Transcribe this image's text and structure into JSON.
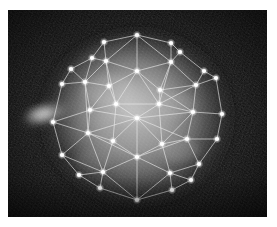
{
  "image": {
    "title": "Triangulated mesh overlay on glowing spheroid",
    "kind": "grayscale-scientific-image",
    "alt_text": "A bright diffuse glowing round object on a dark noisy background, overlaid with a white wireframe triangular mesh connecting bright point nodes.",
    "width": 277,
    "height": 227,
    "margin": {
      "left": 8,
      "top": 10,
      "right": 10,
      "bottom": 11
    },
    "plate": {
      "x": 8,
      "y": 10,
      "width": 259,
      "height": 207
    },
    "colors": {
      "page_background": "#ffffff",
      "plate_background": "#070707",
      "glow_core": "#b9b9b9",
      "glow_mid": "#6e6e6e",
      "glow_outer": "#2a2a2a",
      "node_fill": "#ffffff",
      "edge_stroke": "#e8e8e8",
      "flare": "#f2f2f2"
    },
    "glow": {
      "cx": 137,
      "cy": 117,
      "rx": 95,
      "ry": 88,
      "label": "diffuse luminous halo"
    },
    "flare": {
      "cx": 46,
      "cy": 114,
      "rx": 26,
      "ry": 13,
      "angle": -18,
      "label": "lateral bright flare spike"
    },
    "mesh": {
      "node_count": 38,
      "edge_count": 97,
      "node_radius": 2.1,
      "edge_width": 0.75,
      "nodes": [
        {
          "id": 0,
          "x": 137,
          "y": 35,
          "ring": "hull"
        },
        {
          "id": 1,
          "x": 104,
          "y": 42,
          "ring": "hull"
        },
        {
          "id": 2,
          "x": 171,
          "y": 43,
          "ring": "hull"
        },
        {
          "id": 3,
          "x": 180,
          "y": 52,
          "ring": "hull"
        },
        {
          "id": 4,
          "x": 92,
          "y": 58,
          "ring": "hull"
        },
        {
          "id": 5,
          "x": 71,
          "y": 69,
          "ring": "hull"
        },
        {
          "id": 6,
          "x": 204,
          "y": 71,
          "ring": "hull"
        },
        {
          "id": 7,
          "x": 216,
          "y": 78,
          "ring": "hull"
        },
        {
          "id": 8,
          "x": 62,
          "y": 84,
          "ring": "hull"
        },
        {
          "id": 9,
          "x": 222,
          "y": 114,
          "ring": "hull"
        },
        {
          "id": 10,
          "x": 53,
          "y": 122,
          "ring": "hull"
        },
        {
          "id": 11,
          "x": 217,
          "y": 139,
          "ring": "hull"
        },
        {
          "id": 12,
          "x": 62,
          "y": 155,
          "ring": "hull"
        },
        {
          "id": 13,
          "x": 199,
          "y": 164,
          "ring": "hull"
        },
        {
          "id": 14,
          "x": 79,
          "y": 175,
          "ring": "hull"
        },
        {
          "id": 15,
          "x": 191,
          "y": 180,
          "ring": "hull"
        },
        {
          "id": 16,
          "x": 100,
          "y": 188,
          "ring": "hull"
        },
        {
          "id": 17,
          "x": 172,
          "y": 190,
          "ring": "hull"
        },
        {
          "id": 18,
          "x": 137,
          "y": 200,
          "ring": "hull"
        },
        {
          "id": 19,
          "x": 106,
          "y": 61,
          "ring": "inner1"
        },
        {
          "id": 20,
          "x": 137,
          "y": 71,
          "ring": "inner1"
        },
        {
          "id": 21,
          "x": 171,
          "y": 62,
          "ring": "inner1"
        },
        {
          "id": 22,
          "x": 196,
          "y": 85,
          "ring": "inner1"
        },
        {
          "id": 23,
          "x": 85,
          "y": 82,
          "ring": "inner1"
        },
        {
          "id": 24,
          "x": 109,
          "y": 86,
          "ring": "inner1"
        },
        {
          "id": 25,
          "x": 160,
          "y": 90,
          "ring": "inner1"
        },
        {
          "id": 26,
          "x": 116,
          "y": 104,
          "ring": "inner1"
        },
        {
          "id": 27,
          "x": 159,
          "y": 104,
          "ring": "inner1"
        },
        {
          "id": 28,
          "x": 90,
          "y": 110,
          "ring": "inner1"
        },
        {
          "id": 29,
          "x": 193,
          "y": 112,
          "ring": "inner1"
        },
        {
          "id": 30,
          "x": 137,
          "y": 118,
          "ring": "center"
        },
        {
          "id": 31,
          "x": 88,
          "y": 133,
          "ring": "inner2"
        },
        {
          "id": 32,
          "x": 187,
          "y": 139,
          "ring": "inner2"
        },
        {
          "id": 33,
          "x": 113,
          "y": 141,
          "ring": "inner2"
        },
        {
          "id": 34,
          "x": 162,
          "y": 144,
          "ring": "inner2"
        },
        {
          "id": 35,
          "x": 137,
          "y": 157,
          "ring": "inner2"
        },
        {
          "id": 36,
          "x": 103,
          "y": 172,
          "ring": "inner2"
        },
        {
          "id": 37,
          "x": 170,
          "y": 173,
          "ring": "inner2"
        }
      ],
      "edges": [
        [
          0,
          1
        ],
        [
          0,
          2
        ],
        [
          1,
          4
        ],
        [
          2,
          3
        ],
        [
          3,
          6
        ],
        [
          4,
          5
        ],
        [
          5,
          8
        ],
        [
          6,
          7
        ],
        [
          7,
          9
        ],
        [
          8,
          10
        ],
        [
          9,
          11
        ],
        [
          10,
          12
        ],
        [
          11,
          13
        ],
        [
          12,
          14
        ],
        [
          13,
          15
        ],
        [
          14,
          16
        ],
        [
          15,
          17
        ],
        [
          16,
          18
        ],
        [
          17,
          18
        ],
        [
          0,
          20
        ],
        [
          0,
          19
        ],
        [
          0,
          21
        ],
        [
          1,
          19
        ],
        [
          2,
          21
        ],
        [
          3,
          21
        ],
        [
          4,
          19
        ],
        [
          4,
          23
        ],
        [
          5,
          23
        ],
        [
          5,
          8
        ],
        [
          6,
          22
        ],
        [
          7,
          22
        ],
        [
          8,
          23
        ],
        [
          9,
          29
        ],
        [
          10,
          28
        ],
        [
          10,
          31
        ],
        [
          11,
          32
        ],
        [
          12,
          31
        ],
        [
          12,
          36
        ],
        [
          13,
          37
        ],
        [
          14,
          36
        ],
        [
          15,
          37
        ],
        [
          16,
          36
        ],
        [
          17,
          37
        ],
        [
          18,
          35
        ],
        [
          18,
          36
        ],
        [
          18,
          37
        ],
        [
          19,
          20
        ],
        [
          19,
          24
        ],
        [
          19,
          23
        ],
        [
          20,
          21
        ],
        [
          20,
          24
        ],
        [
          20,
          25
        ],
        [
          20,
          26
        ],
        [
          20,
          27
        ],
        [
          21,
          25
        ],
        [
          21,
          22
        ],
        [
          22,
          25
        ],
        [
          22,
          29
        ],
        [
          23,
          24
        ],
        [
          23,
          28
        ],
        [
          24,
          26
        ],
        [
          24,
          28
        ],
        [
          25,
          27
        ],
        [
          25,
          29
        ],
        [
          26,
          27
        ],
        [
          26,
          28
        ],
        [
          26,
          30
        ],
        [
          26,
          33
        ],
        [
          27,
          30
        ],
        [
          27,
          29
        ],
        [
          27,
          34
        ],
        [
          28,
          30
        ],
        [
          28,
          31
        ],
        [
          29,
          30
        ],
        [
          29,
          32
        ],
        [
          30,
          31
        ],
        [
          30,
          32
        ],
        [
          30,
          33
        ],
        [
          30,
          34
        ],
        [
          30,
          35
        ],
        [
          31,
          33
        ],
        [
          31,
          36
        ],
        [
          32,
          34
        ],
        [
          32,
          13
        ],
        [
          33,
          35
        ],
        [
          33,
          36
        ],
        [
          34,
          35
        ],
        [
          34,
          37
        ],
        [
          35,
          36
        ],
        [
          35,
          37
        ],
        [
          9,
          29
        ],
        [
          22,
          27
        ],
        [
          24,
          20
        ],
        [
          19,
          26
        ],
        [
          21,
          27
        ],
        [
          23,
          31
        ],
        [
          29,
          34
        ],
        [
          31,
          35
        ],
        [
          32,
          35
        ]
      ]
    }
  }
}
